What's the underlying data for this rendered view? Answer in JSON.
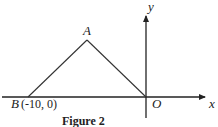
{
  "figure": {
    "caption": "Figure 2",
    "axes": {
      "x_label": "x",
      "y_label": "y",
      "origin_label": "O"
    },
    "points": {
      "A": {
        "label": "A"
      },
      "B": {
        "label": "B",
        "coords_text": "(-10, 0)"
      },
      "O": {
        "label": "O"
      }
    },
    "segments": [
      "BA",
      "AO"
    ]
  }
}
